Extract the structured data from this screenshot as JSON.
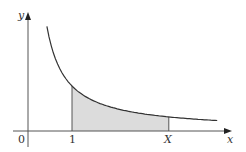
{
  "chart_data": {
    "type": "area",
    "title": "",
    "function": "y = 1/x",
    "xlabel": "x",
    "ylabel": "y",
    "x_ticks": [
      {
        "value": 0,
        "label": "0"
      },
      {
        "value": 1,
        "label": "1"
      },
      {
        "value": 3.2,
        "label": "X"
      }
    ],
    "curve_x_range": [
      0.43,
      4.3
    ],
    "shaded_region": {
      "from": 1,
      "to": 3.2,
      "from_label": "1",
      "to_label": "X"
    },
    "grid": false,
    "legend": null
  },
  "labels": {
    "y_axis": "y",
    "x_axis": "x",
    "origin": "0",
    "one": "1",
    "upper": "X"
  },
  "colors": {
    "axis": "#555555",
    "curve": "#333333",
    "shade": "#dcdcdc",
    "boundary": "#555555"
  }
}
